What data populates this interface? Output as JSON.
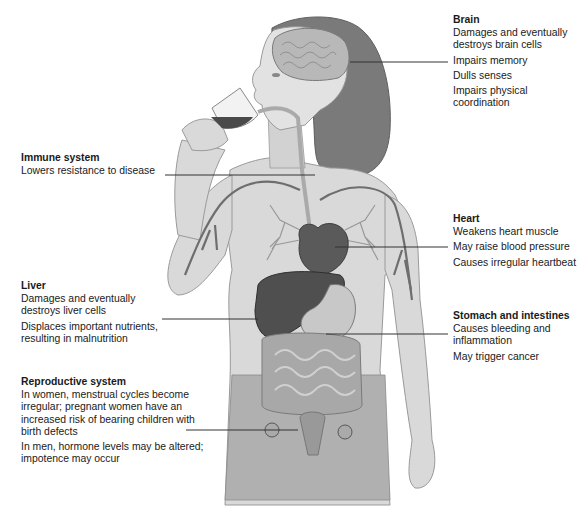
{
  "diagram": {
    "colors": {
      "skin": "#d9d9d9",
      "skin_outline": "#9a9a9a",
      "hair": "#7a7a7a",
      "brain": "#b8b8b8",
      "organ_dark": "#5a5a5a",
      "vessel": "#6e6e6e",
      "leader_line": "#333333",
      "wine": "#4a4a4a",
      "text": "#1a1a1a"
    },
    "labels": [
      {
        "id": "brain",
        "title": "Brain",
        "items": [
          "Damages and eventually destroys brain cells",
          "Impairs memory",
          "Dulls senses",
          "Impairs physical coordination"
        ]
      },
      {
        "id": "immune",
        "title": "Immune system",
        "items": [
          "Lowers resistance to disease"
        ]
      },
      {
        "id": "heart",
        "title": "Heart",
        "items": [
          "Weakens heart muscle",
          "May raise blood pressure",
          "Causes irregular heartbeat"
        ]
      },
      {
        "id": "liver",
        "title": "Liver",
        "items": [
          "Damages and eventually destroys liver cells",
          "Displaces important nutrients, resulting in malnutrition"
        ]
      },
      {
        "id": "stomach",
        "title": "Stomach and intestines",
        "items": [
          "Causes bleeding and inflammation",
          "May trigger cancer"
        ]
      },
      {
        "id": "repro",
        "title": "Reproductive system",
        "items": [
          "In women, menstrual cycles become irregular; pregnant women have an increased risk of bearing children with birth defects",
          "In men, hormone levels may be altered; impotence may occur"
        ]
      }
    ]
  }
}
